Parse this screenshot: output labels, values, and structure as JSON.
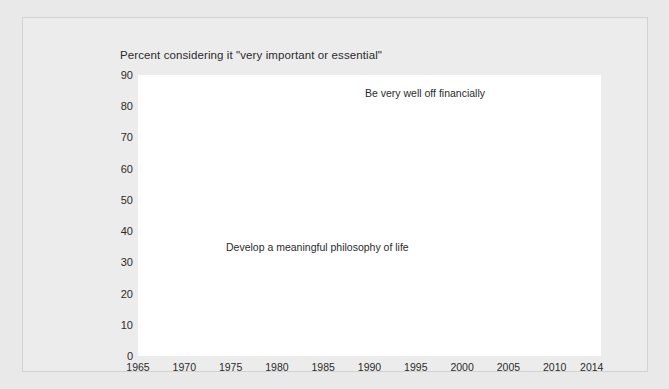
{
  "chart_title": "Percent considering it \"very important or essential\"",
  "axes": {
    "y_ticks": [
      "90",
      "80",
      "70",
      "60",
      "50",
      "40",
      "30",
      "20",
      "10",
      "0"
    ],
    "x_ticks": [
      "1965",
      "1970",
      "1975",
      "1980",
      "1985",
      "1990",
      "1995",
      "2000",
      "2005",
      "2010",
      "2014"
    ]
  },
  "labels": {
    "gray_series": "Be very well off financially",
    "black_series": "Develop a meaningful philosophy of life"
  },
  "colors": {
    "gray_line": "#808080",
    "black_line": "#111111",
    "plot_background": "#ffffff",
    "card_background": "#ececec",
    "page_background": "#e9e9e9",
    "gridline": "#b6b6b6",
    "text": "#2b2b2b"
  },
  "chart_data": {
    "type": "line",
    "title": "Percent considering it \"very important or essential\"",
    "xlabel": "",
    "ylabel": "Percent",
    "xlim": [
      1965,
      2015
    ],
    "ylim": [
      0,
      90
    ],
    "grid": true,
    "legend_position": "inline-annotations",
    "y_ticks": [
      0,
      10,
      20,
      30,
      40,
      50,
      60,
      70,
      80,
      90
    ],
    "x_ticks": [
      1965,
      1970,
      1975,
      1980,
      1985,
      1990,
      1995,
      2000,
      2005,
      2010,
      2014
    ],
    "series": [
      {
        "name": "Develop a meaningful philosophy of life",
        "color": "#111111",
        "x": [
          1967,
          1968,
          1969,
          1970,
          1971,
          1972,
          1973,
          1974,
          1975,
          1976,
          1977,
          1978,
          1979,
          1980,
          1981,
          1982,
          1983,
          1984,
          1985,
          1986,
          1987,
          1988,
          1989,
          1990,
          1991,
          1992,
          1993,
          1994,
          1995,
          1996,
          1997,
          1998,
          1999,
          2000,
          2001,
          2002,
          2003,
          2004,
          2005,
          2006,
          2007,
          2008,
          2009,
          2010,
          2011,
          2012,
          2013,
          2014
        ],
        "values": [
          83,
          83,
          80,
          76,
          71,
          67,
          71,
          69,
          65,
          60,
          64,
          62,
          60,
          57,
          54,
          52,
          49,
          48,
          48,
          45,
          43,
          42,
          41,
          41,
          43,
          45,
          44,
          43,
          43,
          42,
          41,
          41,
          40,
          42,
          44,
          43,
          41,
          40,
          42,
          45,
          47,
          51,
          47,
          46,
          45,
          45,
          45,
          45
        ]
      },
      {
        "name": "Be very well off financially",
        "color": "#808080",
        "x": [
          1966,
          1967,
          1968,
          1969,
          1970,
          1971,
          1972,
          1973,
          1974,
          1975,
          1976,
          1977,
          1978,
          1979,
          1980,
          1981,
          1982,
          1983,
          1984,
          1985,
          1986,
          1987,
          1988,
          1989,
          1990,
          1991,
          1992,
          1993,
          1994,
          1995,
          1996,
          1997,
          1998,
          1999,
          2000,
          2001,
          2002,
          2003,
          2004,
          2005,
          2006,
          2007,
          2008,
          2009,
          2010,
          2011,
          2012,
          2013,
          2014
        ],
        "values": [
          44,
          44,
          42,
          39,
          40,
          43,
          40,
          44,
          47,
          52,
          56,
          58,
          59,
          62,
          64,
          66,
          68,
          70,
          71,
          72,
          74,
          76,
          76,
          75,
          75,
          74,
          74,
          74,
          73,
          74,
          74,
          74,
          73,
          73,
          74,
          73,
          73,
          74,
          74,
          73,
          75,
          74,
          79,
          77,
          78,
          79,
          81,
          82,
          82
        ]
      }
    ],
    "annotations": [
      {
        "text": "Be very well off financially",
        "x": 1989,
        "y": 84
      },
      {
        "text": "Develop a meaningful philosophy of life",
        "x": 1982,
        "y": 36
      }
    ]
  }
}
